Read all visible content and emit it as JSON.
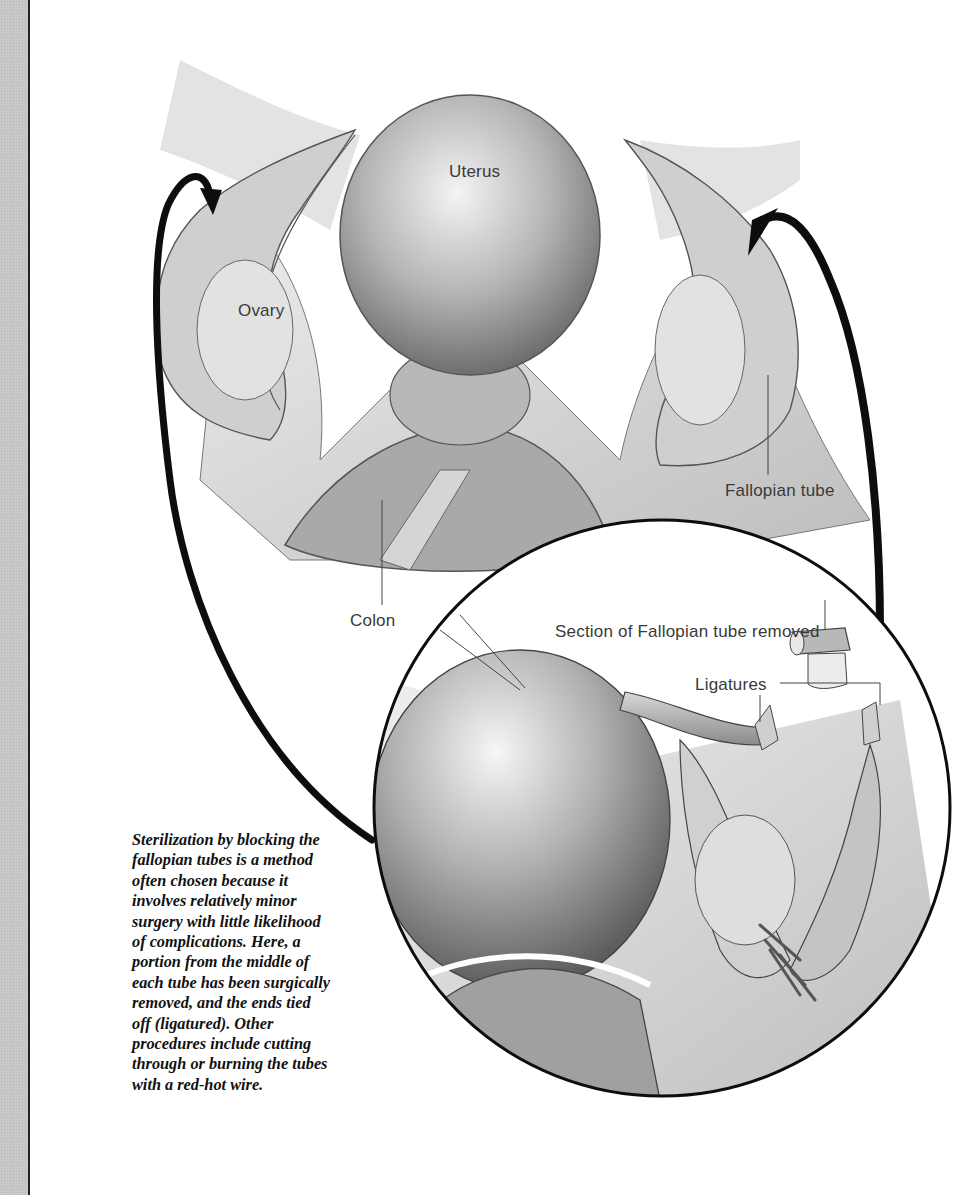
{
  "figure": {
    "labels": {
      "uterus": "Uterus",
      "ovary": "Ovary",
      "fallopian_tube": "Fallopian tube",
      "colon": "Colon",
      "section_removed": "Section of Fallopian tube removed",
      "ligatures": "Ligatures"
    },
    "arrows": [
      {
        "name": "left-arrow",
        "direction": "from inset circle to left tube"
      },
      {
        "name": "right-arrow",
        "direction": "from inset circle to right tube"
      }
    ],
    "inset": {
      "shape": "circle",
      "description": "magnified view of tubal ligation"
    }
  },
  "caption": {
    "lines": [
      "Sterilization by blocking the",
      "fallopian tubes is a method",
      "often chosen because it",
      "involves relatively minor",
      "surgery with little likelihood",
      "of complications. Here, a",
      "portion from the middle of",
      "each tube has been surgically",
      "removed, and the ends tied",
      "off (ligatured). Other",
      "procedures include cutting",
      "through or burning the tubes",
      "with a red-hot wire."
    ]
  },
  "colors": {
    "stripe": "#c8c8c8",
    "ink": "#111111",
    "label_text": "#3a3a3a"
  }
}
